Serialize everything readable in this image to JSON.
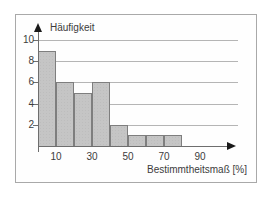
{
  "chart": {
    "y_axis_title": "Häufigkeit",
    "x_axis_title": "Bestimmtheitsmaß [%]"
  },
  "chart_data": {
    "type": "bar",
    "title": "",
    "xlabel": "Bestimmtheitsmaß [%]",
    "ylabel": "Häufigkeit",
    "bin_width": 10,
    "bins_start": [
      0,
      10,
      20,
      30,
      40,
      50,
      60,
      70
    ],
    "values": [
      9,
      6,
      5,
      6,
      2,
      1,
      1,
      1
    ],
    "x_ticks": [
      10,
      30,
      50,
      70,
      90
    ],
    "y_ticks": [
      2,
      4,
      6,
      8,
      10
    ],
    "xlim": [
      0,
      107
    ],
    "ylim": [
      0,
      11
    ],
    "grid": "horizontal-only",
    "legend": "none",
    "colors": {
      "bar_fill": "#c5c5c5",
      "bar_border": "#7e7e7e",
      "grid": "#b5b5b5",
      "axis": "#6e6e6e",
      "arrow": "#1a1a1a",
      "text": "#3c3c3c",
      "frame_border": "#a9a9a9",
      "background": "#ffffff"
    }
  }
}
